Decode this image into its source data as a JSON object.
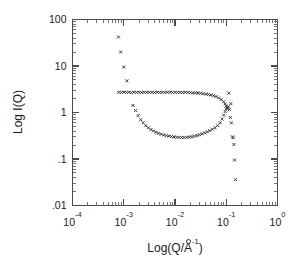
{
  "figure": {
    "background": "#ffffff",
    "frame_color": "#4a4a4a",
    "marker_color": "#2b2b2b"
  },
  "chart_data": {
    "type": "scatter",
    "title": "",
    "subtitle": "",
    "xlabel": "Log(Q/Å⁻¹)",
    "ylabel": "Log I(Q)",
    "xlabel_parts": {
      "prefix": "Log(Q/",
      "angstrom": "A",
      "ring": "o",
      "exponent": "-1",
      "suffix": ")"
    },
    "xscale": "log",
    "yscale": "log",
    "xlim": [
      0.0001,
      1
    ],
    "ylim": [
      0.01,
      100
    ],
    "grid": false,
    "legend": null,
    "xticks": [
      0.0001,
      0.001,
      0.01,
      0.1,
      1
    ],
    "xtick_labels": [
      "10-4",
      "10-3",
      "10-2",
      "10-1",
      "100"
    ],
    "xtick_mantissa": [
      "10",
      "10",
      "10",
      "10",
      "10"
    ],
    "xtick_exponents": [
      "-4",
      "-3",
      "-2",
      "-1",
      "0"
    ],
    "yticks": [
      0.01,
      0.1,
      1,
      10,
      100
    ],
    "ytick_labels": [
      ".01",
      ".1",
      "1",
      "10",
      "100"
    ],
    "minor_ticks": true,
    "tick_direction": "in",
    "marker_symbol": "x",
    "marker_size": 3.0,
    "series": [
      {
        "name": "low-Q steep descent",
        "points": [
          [
            0.00079,
            42.0
          ],
          [
            0.00087,
            20.0
          ],
          [
            0.001,
            9.5
          ],
          [
            0.00115,
            4.8
          ]
        ]
      },
      {
        "name": "upper branch plateau",
        "points": [
          [
            0.00079,
            2.72
          ],
          [
            0.0009,
            2.7
          ],
          [
            0.00101,
            2.74
          ],
          [
            0.00113,
            2.7
          ],
          [
            0.00126,
            2.72
          ],
          [
            0.00141,
            2.68
          ],
          [
            0.00158,
            2.73
          ],
          [
            0.00178,
            2.7
          ],
          [
            0.002,
            2.72
          ],
          [
            0.00224,
            2.69
          ],
          [
            0.00251,
            2.73
          ],
          [
            0.00282,
            2.7
          ],
          [
            0.00316,
            2.72
          ],
          [
            0.00355,
            2.71
          ],
          [
            0.00398,
            2.69
          ],
          [
            0.00447,
            2.73
          ],
          [
            0.00501,
            2.7
          ],
          [
            0.00562,
            2.72
          ],
          [
            0.00631,
            2.7
          ],
          [
            0.00708,
            2.71
          ],
          [
            0.00794,
            2.73
          ],
          [
            0.00891,
            2.7
          ],
          [
            0.01,
            2.72
          ],
          [
            0.01122,
            2.7
          ],
          [
            0.01259,
            2.71
          ],
          [
            0.01413,
            2.69
          ],
          [
            0.01585,
            2.72
          ],
          [
            0.01778,
            2.7
          ],
          [
            0.01995,
            2.68
          ],
          [
            0.02239,
            2.66
          ],
          [
            0.02512,
            2.64
          ],
          [
            0.02818,
            2.62
          ],
          [
            0.03162,
            2.58
          ],
          [
            0.03548,
            2.54
          ],
          [
            0.03981,
            2.5
          ],
          [
            0.04467,
            2.44
          ],
          [
            0.05012,
            2.38
          ],
          [
            0.05623,
            2.3
          ],
          [
            0.0631,
            2.2
          ],
          [
            0.07079,
            2.06
          ],
          [
            0.07943,
            1.9
          ],
          [
            0.08913,
            1.7
          ],
          [
            0.0955,
            1.52
          ],
          [
            0.1,
            1.38
          ],
          [
            0.10471,
            1.24
          ]
        ]
      },
      {
        "name": "lower branch",
        "points": [
          [
            0.00151,
            1.42
          ],
          [
            0.0017,
            1.1
          ],
          [
            0.00191,
            0.86
          ],
          [
            0.00214,
            0.7
          ],
          [
            0.0024,
            0.6
          ],
          [
            0.00269,
            0.52
          ],
          [
            0.00302,
            0.47
          ],
          [
            0.00339,
            0.43
          ],
          [
            0.0038,
            0.4
          ],
          [
            0.00427,
            0.375
          ],
          [
            0.00479,
            0.355
          ],
          [
            0.00537,
            0.34
          ],
          [
            0.00603,
            0.328
          ],
          [
            0.00676,
            0.318
          ],
          [
            0.00759,
            0.31
          ],
          [
            0.00851,
            0.303
          ],
          [
            0.00955,
            0.298
          ],
          [
            0.01072,
            0.294
          ],
          [
            0.01202,
            0.291
          ],
          [
            0.01349,
            0.29
          ],
          [
            0.01514,
            0.29
          ],
          [
            0.01698,
            0.292
          ],
          [
            0.01905,
            0.296
          ],
          [
            0.02138,
            0.302
          ],
          [
            0.02399,
            0.31
          ],
          [
            0.02692,
            0.32
          ],
          [
            0.0302,
            0.333
          ],
          [
            0.03388,
            0.348
          ],
          [
            0.03802,
            0.365
          ],
          [
            0.04266,
            0.385
          ],
          [
            0.04786,
            0.408
          ],
          [
            0.0537,
            0.436
          ],
          [
            0.06026,
            0.47
          ],
          [
            0.06761,
            0.52
          ],
          [
            0.07586,
            0.6
          ],
          [
            0.08318,
            0.72
          ],
          [
            0.08913,
            0.88
          ],
          [
            0.0955,
            1.05
          ],
          [
            0.1,
            1.2
          ],
          [
            0.10471,
            1.26
          ]
        ]
      },
      {
        "name": "high-Q tail",
        "points": [
          [
            0.1122,
            2.6
          ],
          [
            0.11,
            1.33
          ],
          [
            0.115,
            1.15
          ],
          [
            0.123,
            1.55
          ],
          [
            0.12,
            0.78
          ],
          [
            0.126,
            0.6
          ],
          [
            0.132,
            0.3
          ],
          [
            0.138,
            0.285
          ],
          [
            0.141,
            0.205
          ],
          [
            0.145,
            0.095
          ],
          [
            0.151,
            0.036
          ]
        ]
      }
    ]
  }
}
